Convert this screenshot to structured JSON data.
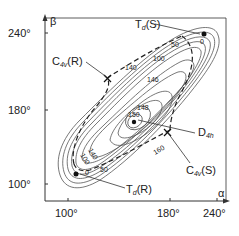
{
  "diagram": {
    "axes": {
      "x_label": "α",
      "y_label": "β",
      "x_ticks": [
        "100°",
        "180°",
        "240°"
      ],
      "y_ticks": [
        "240°",
        "180°",
        "100°"
      ]
    },
    "points": {
      "td_s": {
        "main": "T",
        "sub": "d",
        "paren": "(S)"
      },
      "td_r": {
        "main": "T",
        "sub": "d",
        "paren": "(R)"
      },
      "c4v_r": {
        "main": "C",
        "sub": "4v",
        "paren": "(R)"
      },
      "c4v_s": {
        "main": "C",
        "sub": "4v",
        "paren": "(S)"
      },
      "d4h": {
        "main": "D",
        "sub": "4h",
        "paren": ""
      }
    },
    "contour_labels": {
      "c150": "150",
      "c148a": "148",
      "c146": "146",
      "c140a": "140",
      "c140b": "140",
      "c100a": "100",
      "c100b": "100",
      "c50a": "50",
      "c50b": "50",
      "c0a": "0",
      "c0b": "0",
      "c160": "160"
    },
    "colors": {
      "line": "#333333",
      "background": "#ffffff"
    }
  }
}
